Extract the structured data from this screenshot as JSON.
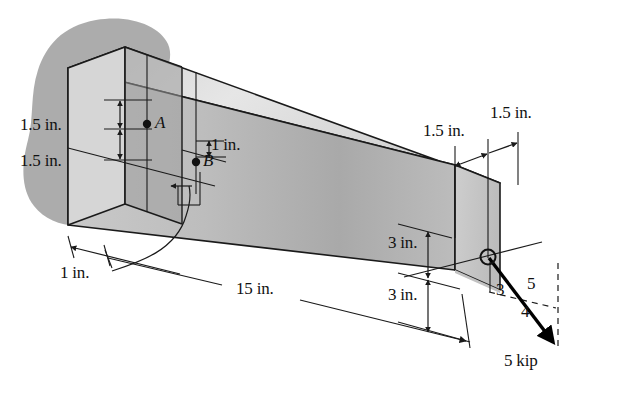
{
  "figure": {
    "colors": {
      "outline": "#1a1a1a",
      "front_face": "#b5b5b5",
      "top_face": "#dcdcdc",
      "end_face": "#c8c8c8",
      "left_face": "#cfcfcf",
      "section_face": "#a0a0a0",
      "wall_blob": "#a8a8a8",
      "force_arrow": "#000000",
      "dimension_line": "#1a1a1a",
      "background": "#ffffff"
    },
    "dimensions": [
      {
        "id": "left-upper",
        "label": "1.5 in.",
        "x": 20,
        "y": 116
      },
      {
        "id": "left-lower",
        "label": "1.5 in.",
        "x": 20,
        "y": 152
      },
      {
        "id": "b-offset",
        "label": "1 in.",
        "x": 211,
        "y": 136
      },
      {
        "id": "depth-offset",
        "label": "1 in.",
        "x": 60,
        "y": 273
      },
      {
        "id": "length",
        "label": "15 in.",
        "x": 236,
        "y": 288
      },
      {
        "id": "end-upper",
        "label": "3 in.",
        "x": 412,
        "y": 248
      },
      {
        "id": "end-lower",
        "label": "3 in.",
        "x": 412,
        "y": 296
      },
      {
        "id": "width-left",
        "label": "1.5 in.",
        "x": 427,
        "y": 126
      },
      {
        "id": "width-right",
        "label": "1.5 in.",
        "x": 492,
        "y": 110
      }
    ],
    "points": [
      {
        "id": "A",
        "label": "A",
        "x": 155,
        "y": 117,
        "dot_x": 147,
        "dot_y": 124
      },
      {
        "id": "B",
        "label": "B",
        "x": 203,
        "y": 155,
        "dot_x": 196,
        "dot_y": 162
      }
    ],
    "force": {
      "magnitude_label": "5 kip",
      "magnitude_x": 504,
      "magnitude_y": 355,
      "slope_triangle": {
        "vertical_label": "3",
        "hypotenuse_label": "5",
        "horizontal_label": "4",
        "vertical_x": 496,
        "vertical_y": 281,
        "hypotenuse_x": 527,
        "hypotenuse_y": 278,
        "horizontal_x": 521,
        "horizontal_y": 305
      },
      "application_point": {
        "x": 488,
        "y": 257
      },
      "tip": {
        "x": 556,
        "y": 345
      }
    }
  }
}
